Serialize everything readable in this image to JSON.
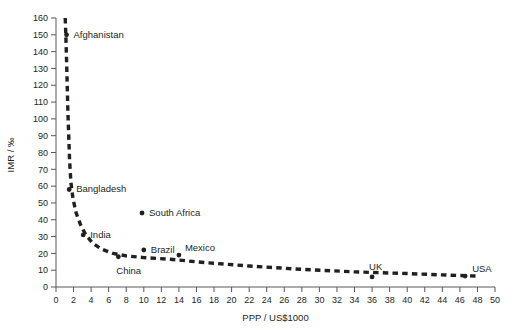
{
  "chart_data": {
    "type": "scatter",
    "title": "",
    "xlabel": "PPP / US$1000",
    "ylabel": "IMR / ‰",
    "xlim": [
      0,
      50
    ],
    "ylim": [
      0,
      160
    ],
    "xticks": [
      0,
      2,
      4,
      6,
      8,
      10,
      12,
      14,
      16,
      18,
      20,
      22,
      24,
      26,
      28,
      30,
      32,
      34,
      36,
      38,
      40,
      42,
      44,
      46,
      48,
      50
    ],
    "yticks": [
      0,
      10,
      20,
      30,
      40,
      50,
      60,
      70,
      80,
      90,
      100,
      110,
      120,
      130,
      140,
      150,
      160
    ],
    "grid": false,
    "legend": "none",
    "points": [
      {
        "name": "Afghanistan",
        "x": 1.2,
        "y": 150,
        "label_dx": 7,
        "label_dy": 3
      },
      {
        "name": "Bangladesh",
        "x": 1.5,
        "y": 58,
        "label_dx": 7,
        "label_dy": 3
      },
      {
        "name": "India",
        "x": 3.1,
        "y": 31,
        "label_dx": 7,
        "label_dy": 3
      },
      {
        "name": "China",
        "x": 7.1,
        "y": 18,
        "label_dx": -2,
        "label_dy": 17
      },
      {
        "name": "South Africa",
        "x": 9.8,
        "y": 44,
        "label_dx": 7,
        "label_dy": 3
      },
      {
        "name": "Brazil",
        "x": 10.0,
        "y": 22,
        "label_dx": 7,
        "label_dy": 3
      },
      {
        "name": "Mexico",
        "x": 14.0,
        "y": 19,
        "label_dx": 6,
        "label_dy": -4
      },
      {
        "name": "UK",
        "x": 36.0,
        "y": 6,
        "label_dx": -3,
        "label_dy": -7
      },
      {
        "name": "USA",
        "x": 46.6,
        "y": 6.5,
        "label_dx": 7,
        "label_dy": -4
      }
    ],
    "curve": [
      {
        "x": 1.05,
        "y": 160
      },
      {
        "x": 1.12,
        "y": 150
      },
      {
        "x": 1.2,
        "y": 135
      },
      {
        "x": 1.28,
        "y": 120
      },
      {
        "x": 1.35,
        "y": 105
      },
      {
        "x": 1.45,
        "y": 90
      },
      {
        "x": 1.55,
        "y": 75
      },
      {
        "x": 1.7,
        "y": 62
      },
      {
        "x": 1.95,
        "y": 52
      },
      {
        "x": 2.3,
        "y": 44
      },
      {
        "x": 2.8,
        "y": 37
      },
      {
        "x": 3.4,
        "y": 31
      },
      {
        "x": 4.2,
        "y": 26
      },
      {
        "x": 5.2,
        "y": 22.5
      },
      {
        "x": 6.5,
        "y": 20
      },
      {
        "x": 8.0,
        "y": 18.5
      },
      {
        "x": 10.0,
        "y": 17.5
      },
      {
        "x": 13.0,
        "y": 16.5
      },
      {
        "x": 17.0,
        "y": 14.5
      },
      {
        "x": 22.0,
        "y": 12.5
      },
      {
        "x": 28.0,
        "y": 10.5
      },
      {
        "x": 34.0,
        "y": 9
      },
      {
        "x": 40.0,
        "y": 8
      },
      {
        "x": 45.0,
        "y": 7
      },
      {
        "x": 48.0,
        "y": 6.5
      }
    ]
  }
}
